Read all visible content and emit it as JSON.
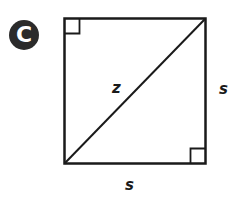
{
  "figure": {
    "badge_letter": "C",
    "labels": {
      "diagonal": "z",
      "right_side": "s",
      "bottom_side": "s"
    },
    "shape": "square",
    "right_angle_markers": [
      "top-left",
      "bottom-right"
    ],
    "diagonal": "bottom-left to top-right",
    "colors": {
      "stroke": "#1a1a1a",
      "badge_bg": "#2b2b2b",
      "badge_text": "#ffffff",
      "background": "#ffffff"
    }
  }
}
